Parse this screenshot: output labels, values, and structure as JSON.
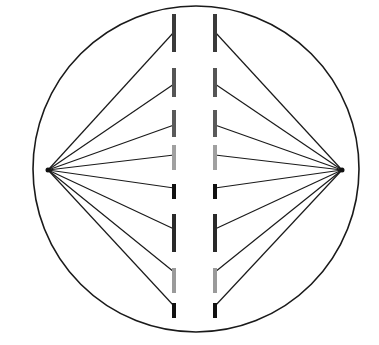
{
  "diagram": {
    "title": "",
    "cell": {
      "cx": 196,
      "cy": 169,
      "r": 163,
      "stroke": "#1a1a1a",
      "stroke_width": 1.6
    },
    "poles": [
      {
        "id": "left-pole",
        "x": 48,
        "y": 170
      },
      {
        "id": "right-pole",
        "x": 342,
        "y": 170
      }
    ],
    "columns": {
      "left_x": 174,
      "right_x": 215,
      "segment_width": 4
    },
    "segments": [
      {
        "y1": 14,
        "y2": 52,
        "attach_y": 32,
        "color": "#3a3a3a"
      },
      {
        "y1": 68,
        "y2": 97,
        "attach_y": 84,
        "color": "#555555"
      },
      {
        "y1": 110,
        "y2": 137,
        "attach_y": 125,
        "color": "#5a5a5a"
      },
      {
        "y1": 145,
        "y2": 170,
        "attach_y": 155,
        "color": "#a0a0a0"
      },
      {
        "y1": 184,
        "y2": 199,
        "attach_y": 188,
        "color": "#111111"
      },
      {
        "y1": 214,
        "y2": 252,
        "attach_y": 229,
        "color": "#2a2a2a"
      },
      {
        "y1": 268,
        "y2": 293,
        "attach_y": 272,
        "color": "#9a9a9a"
      },
      {
        "y1": 303,
        "y2": 318,
        "attach_y": 306,
        "color": "#111111"
      }
    ],
    "fiber_color": "#1a1a1a",
    "fiber_width": 1.2
  }
}
